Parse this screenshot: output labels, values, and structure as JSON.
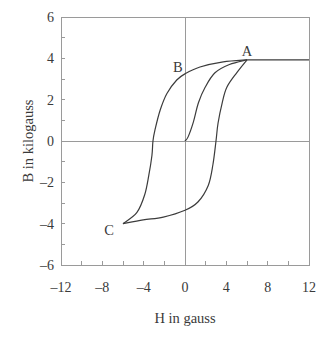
{
  "chart_data": {
    "type": "line",
    "title": "",
    "xlabel": "H in gauss",
    "ylabel": "B in kilogauss",
    "xlim": [
      -12,
      12
    ],
    "ylim": [
      -6,
      6
    ],
    "grid": false,
    "zero_lines": true,
    "legend": null,
    "xticks": [
      -12,
      -8,
      -4,
      0,
      4,
      8,
      12
    ],
    "xtick_labels": [
      "–12",
      "–8",
      "–4",
      "0",
      "4",
      "8",
      "12"
    ],
    "xminor_ticks": [
      -10,
      -6,
      -2,
      2,
      6,
      10
    ],
    "yticks": [
      -6,
      -4,
      -2,
      0,
      2,
      4,
      6
    ],
    "ytick_labels": [
      "–6",
      "–4",
      "–2",
      "0",
      "2",
      "4",
      "6"
    ],
    "yminor_ticks": [
      -5,
      -3,
      -1,
      1,
      3,
      5
    ],
    "series": [
      {
        "name": "initial magnetization curve",
        "x": [
          0,
          0.3,
          0.8,
          1.3,
          1.95,
          2.9,
          4.3,
          6.0
        ],
        "y": [
          0,
          0.2,
          0.9,
          1.85,
          2.6,
          3.3,
          3.7,
          3.93
        ]
      },
      {
        "name": "descending branch A-B-C",
        "x": [
          6.0,
          3.7,
          1.45,
          0,
          -0.8,
          -1.75,
          -2.4,
          -2.9,
          -3.1,
          -3.2,
          -3.5,
          -3.9,
          -4.65,
          -6.0
        ],
        "y": [
          3.93,
          3.83,
          3.58,
          3.25,
          2.95,
          2.3,
          1.5,
          0.55,
          0,
          -0.7,
          -1.65,
          -2.6,
          -3.45,
          -4.0
        ]
      },
      {
        "name": "ascending branch C-A",
        "x": [
          -6.0,
          -4.05,
          -2.1,
          0,
          1.25,
          2.25,
          2.7,
          3.0,
          3.2,
          3.6,
          4.05,
          5.0,
          6.0
        ],
        "y": [
          -4.0,
          -3.82,
          -3.68,
          -3.35,
          -2.95,
          -2.15,
          -1.15,
          0,
          0.87,
          1.85,
          2.6,
          3.3,
          3.93
        ]
      },
      {
        "name": "saturation",
        "x": [
          6.0,
          12.0
        ],
        "y": [
          3.93,
          3.93
        ]
      }
    ],
    "annotations": [
      {
        "text": "A",
        "x": 6.0,
        "y": 4.35
      },
      {
        "text": "B",
        "x": -0.7,
        "y": 3.6
      },
      {
        "text": "C",
        "x": -7.35,
        "y": -4.3
      }
    ]
  },
  "colors": {
    "axis": "#9a9a9a",
    "curve": "#3c3c3c",
    "text": "#3a3a3a"
  }
}
